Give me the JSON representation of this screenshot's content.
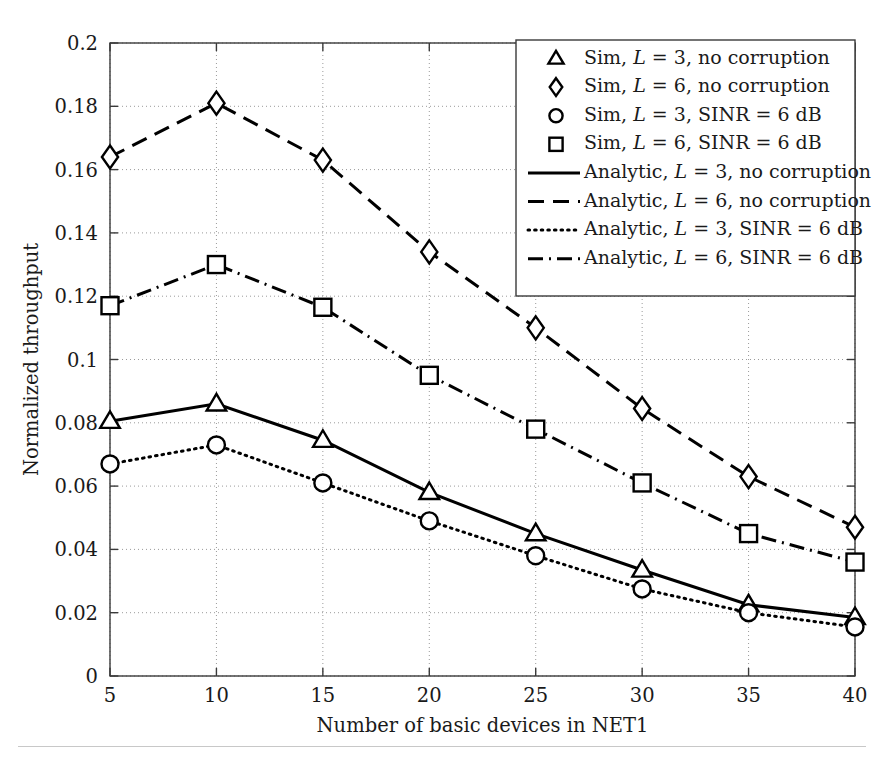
{
  "chart_data": {
    "type": "line",
    "title": "",
    "xlabel": "Number of basic devices in NET1",
    "ylabel": "Normalized throughput",
    "x": [
      5,
      10,
      15,
      20,
      25,
      30,
      35,
      40
    ],
    "xlim": [
      5,
      40
    ],
    "ylim": [
      0,
      0.2
    ],
    "xticks": [
      "5",
      "10",
      "15",
      "20",
      "25",
      "30",
      "35",
      "40"
    ],
    "yticks": [
      "0",
      "0.02",
      "0.04",
      "0.06",
      "0.08",
      "0.1",
      "0.12",
      "0.14",
      "0.16",
      "0.18",
      "0.2"
    ],
    "ytick_values": [
      0,
      0.02,
      0.04,
      0.06,
      0.08,
      0.1,
      0.12,
      0.14,
      0.16,
      0.18,
      0.2
    ],
    "grid": "dotted-both",
    "legend_position": "top-right",
    "line_color": "#000000",
    "grid_color": "#9a9a9a",
    "series": [
      {
        "name": "Sim, L = 3, no corruption",
        "legend_label_parts": [
          "Sim, ",
          "L",
          " = 3, no corruption"
        ],
        "kind": "markers",
        "marker": "triangle",
        "values": [
          0.0805,
          0.086,
          0.0745,
          0.058,
          0.045,
          0.0335,
          0.0225,
          0.0185
        ]
      },
      {
        "name": "Sim, L = 6, no corruption",
        "legend_label_parts": [
          "Sim, ",
          "L",
          " = 6, no corruption"
        ],
        "kind": "markers",
        "marker": "diamond",
        "values": [
          0.164,
          0.181,
          0.163,
          0.134,
          0.11,
          0.0845,
          0.063,
          0.047
        ]
      },
      {
        "name": "Sim, L = 3, SINR = 6 dB",
        "legend_label_parts": [
          "Sim, ",
          "L",
          " = 3, SINR = 6 dB"
        ],
        "kind": "markers",
        "marker": "circle",
        "values": [
          0.067,
          0.073,
          0.061,
          0.049,
          0.038,
          0.0275,
          0.02,
          0.0155
        ]
      },
      {
        "name": "Sim, L = 6, SINR = 6 dB",
        "legend_label_parts": [
          "Sim, ",
          "L",
          " = 6, SINR = 6 dB"
        ],
        "kind": "markers",
        "marker": "square",
        "values": [
          0.117,
          0.13,
          0.1165,
          0.095,
          0.078,
          0.061,
          0.045,
          0.036
        ]
      },
      {
        "name": "Analytic, L = 3, no corruption",
        "legend_label_parts": [
          "Analytic, ",
          "L",
          " = 3, no corruption"
        ],
        "kind": "line",
        "linestyle": "solid",
        "values": [
          0.0805,
          0.086,
          0.0745,
          0.058,
          0.045,
          0.0335,
          0.0225,
          0.0185
        ]
      },
      {
        "name": "Analytic, L = 6, no corruption",
        "legend_label_parts": [
          "Analytic, ",
          "L",
          " = 6, no corruption"
        ],
        "kind": "line",
        "linestyle": "dashed",
        "values": [
          0.164,
          0.181,
          0.163,
          0.134,
          0.11,
          0.0845,
          0.063,
          0.047
        ]
      },
      {
        "name": "Analytic, L = 3, SINR = 6 dB",
        "legend_label_parts": [
          "Analytic, ",
          "L",
          " = 3, SINR = 6 dB"
        ],
        "kind": "line",
        "linestyle": "dotted",
        "values": [
          0.067,
          0.073,
          0.061,
          0.049,
          0.038,
          0.0275,
          0.02,
          0.0155
        ]
      },
      {
        "name": "Analytic, L = 6, SINR = 6 dB",
        "legend_label_parts": [
          "Analytic, ",
          "L",
          " = 6, SINR = 6 dB"
        ],
        "kind": "line",
        "linestyle": "dashdot",
        "values": [
          0.117,
          0.13,
          0.1165,
          0.095,
          0.078,
          0.061,
          0.045,
          0.036
        ]
      }
    ]
  }
}
